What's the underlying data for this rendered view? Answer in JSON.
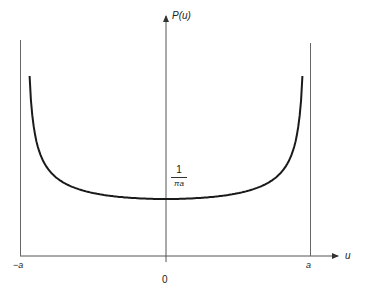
{
  "chart_data": {
    "type": "line",
    "title": "",
    "xlabel": "u",
    "ylabel": "P(u)",
    "x_ticks": [
      "-a",
      "0",
      "a"
    ],
    "annotations": [
      {
        "text": "1/(πa)",
        "position": "y-value of curve minimum at u=0"
      }
    ],
    "function": "P(u) = 1 / (π·sqrt(a² − u²)), |u| < a",
    "xlim": [
      "-a",
      "a"
    ],
    "grid": false,
    "legend": null,
    "vertical_asymptotes": [
      "-a",
      "a"
    ],
    "series": [
      {
        "name": "P(u)",
        "x_normalized": [
          -0.98,
          -0.95,
          -0.9,
          -0.8,
          -0.6,
          -0.4,
          -0.2,
          0,
          0.2,
          0.4,
          0.6,
          0.8,
          0.9,
          0.95,
          0.98
        ],
        "y_relative_to_min": [
          5.03,
          3.2,
          2.29,
          1.67,
          1.25,
          1.09,
          1.02,
          1.0,
          1.02,
          1.09,
          1.25,
          1.67,
          2.29,
          3.2,
          5.03
        ]
      }
    ]
  },
  "labels": {
    "y_axis": "P(u)",
    "x_axis": "u",
    "neg_a": "−a",
    "pos_a": "a",
    "origin": "0",
    "frac_num": "1",
    "frac_den": "πa"
  },
  "colors": {
    "curve": "#1a1a1a",
    "axes": "#555555"
  }
}
